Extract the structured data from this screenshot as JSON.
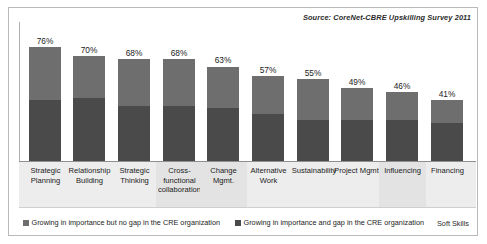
{
  "source_note": "Source: CoreNet-CBRE Upskilling Survey 2011",
  "soft_skills_note": "Soft Skills",
  "colors": {
    "series_no_gap": "#6e6e6e",
    "series_gap": "#4a4a4a",
    "frame_border": "#b9b9b9",
    "label_band": "#ededed",
    "axis": "#8f8f8f"
  },
  "legend": [
    {
      "label": "Growing in importance but no gap in the CRE organization",
      "color": "#6e6e6e"
    },
    {
      "label": "Growing in importance and gap in the CRE organization",
      "color": "#4a4a4a"
    }
  ],
  "chart_data": {
    "type": "bar",
    "subtype": "stacked-column",
    "title": "",
    "subtitle": "",
    "xlabel": "",
    "ylabel": "",
    "ylim": [
      0,
      100
    ],
    "grid": false,
    "legend_position": "bottom",
    "annotations": [
      "Source: CoreNet-CBRE Upskilling Survey 2011",
      "Soft Skills"
    ],
    "categories": [
      "Strategic Planning",
      "Relationship Building",
      "Strategic Thinking",
      "Cross-functional collaboration",
      "Change Mgmt.",
      "Alternative Work",
      "Sustainability",
      "Project Mgmt.",
      "Influencing",
      "Financing"
    ],
    "data_labels": [
      "76%",
      "70%",
      "68%",
      "68%",
      "63%",
      "57%",
      "55%",
      "49%",
      "46%",
      "41%"
    ],
    "totals": [
      76,
      70,
      68,
      68,
      63,
      57,
      55,
      49,
      46,
      41
    ],
    "series": [
      {
        "name": "Growing in importance but no gap in the CRE organization",
        "color": "#6e6e6e",
        "values": [
          35,
          28,
          31,
          31,
          27,
          25,
          27,
          21,
          18,
          15
        ]
      },
      {
        "name": "Growing in importance and gap in the CRE organization",
        "color": "#4a4a4a",
        "values": [
          41,
          42,
          37,
          37,
          36,
          32,
          28,
          28,
          28,
          26
        ]
      }
    ]
  },
  "bars": [
    {
      "value_label": "76%",
      "total": 76,
      "seg_top": 35,
      "seg_bottom": 41,
      "category": "Strategic Planning",
      "left": 20,
      "width": 32,
      "label_left": 13,
      "label_width": 47,
      "highlight": false
    },
    {
      "value_label": "70%",
      "total": 70,
      "seg_top": 28,
      "seg_bottom": 42,
      "category": "Relationship Building",
      "left": 64,
      "width": 32,
      "label_left": 57,
      "label_width": 47,
      "highlight": false
    },
    {
      "value_label": "68%",
      "total": 68,
      "seg_top": 31,
      "seg_bottom": 37,
      "category": "Strategic Thinking",
      "left": 109,
      "width": 32,
      "label_left": 102,
      "label_width": 47,
      "highlight": false
    },
    {
      "value_label": "68%",
      "total": 68,
      "seg_top": 31,
      "seg_bottom": 37,
      "category": "Cross-functional collaboration",
      "left": 154,
      "width": 32,
      "label_left": 147,
      "label_width": 47,
      "highlight": true
    },
    {
      "value_label": "63%",
      "total": 63,
      "seg_top": 27,
      "seg_bottom": 36,
      "category": "Change Mgmt.",
      "left": 198,
      "width": 32,
      "label_left": 191,
      "label_width": 47,
      "highlight": true
    },
    {
      "value_label": "57%",
      "total": 57,
      "seg_top": 25,
      "seg_bottom": 32,
      "category": "Alternative Work",
      "left": 243,
      "width": 32,
      "label_left": 236,
      "label_width": 47,
      "highlight": false
    },
    {
      "value_label": "55%",
      "total": 55,
      "seg_top": 27,
      "seg_bottom": 28,
      "category": "Sustainability",
      "left": 288,
      "width": 32,
      "label_left": 279,
      "label_width": 52,
      "highlight": false
    },
    {
      "value_label": "49%",
      "total": 49,
      "seg_top": 21,
      "seg_bottom": 28,
      "category": "Project Mgmt.",
      "left": 332,
      "width": 32,
      "label_left": 325,
      "label_width": 47,
      "highlight": false
    },
    {
      "value_label": "46%",
      "total": 46,
      "seg_top": 18,
      "seg_bottom": 28,
      "category": "Influencing",
      "left": 377,
      "width": 32,
      "label_left": 370,
      "label_width": 47,
      "highlight": true
    },
    {
      "value_label": "41%",
      "total": 41,
      "seg_top": 15,
      "seg_bottom": 26,
      "category": "Financing",
      "left": 422,
      "width": 32,
      "label_left": 415,
      "label_width": 47,
      "highlight": false
    }
  ]
}
